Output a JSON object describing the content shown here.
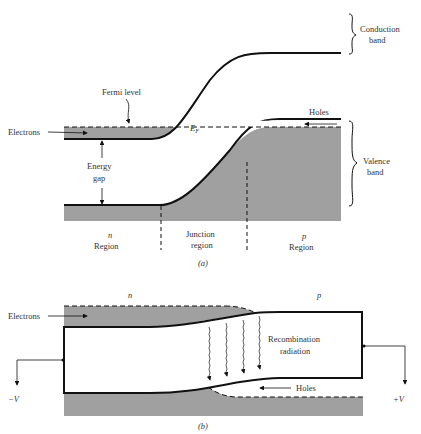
{
  "colors": {
    "band_fill": "#a0a0a0",
    "line": "#111111",
    "background": "#ffffff",
    "text": "#333333"
  },
  "figure_a": {
    "caption": "(a)",
    "labels": {
      "conduction_line1": "Conduction",
      "conduction_line2": "band",
      "valence_line1": "Valence",
      "valence_line2": "band",
      "fermi_level": "Fermi level",
      "electrons": "Electrons",
      "holes": "Holes",
      "ef": "E",
      "ef_sub": "F",
      "energy_gap_line1": "Energy",
      "energy_gap_line2": "gap",
      "n_region_letter": "n",
      "n_region_word": "Region",
      "junction_line1": "Junction",
      "junction_line2": "region",
      "p_region_letter": "p",
      "p_region_word": "Region"
    }
  },
  "figure_b": {
    "caption": "(b)",
    "labels": {
      "n": "n",
      "p": "p",
      "electrons": "Electrons",
      "recombination_line1": "Recombination",
      "recombination_line2": "radiation",
      "holes": "Holes",
      "minus_v": "−V",
      "plus_v": "+V"
    }
  }
}
